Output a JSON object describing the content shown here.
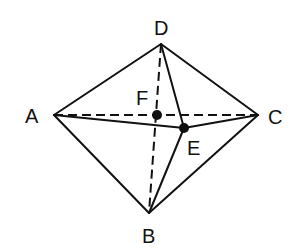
{
  "diagram": {
    "type": "octahedron-like solid",
    "points": {
      "A": {
        "label": "A",
        "x": 54,
        "y": 115
      },
      "B": {
        "label": "B",
        "x": 149,
        "y": 213
      },
      "C": {
        "label": "C",
        "x": 258,
        "y": 115
      },
      "D": {
        "label": "D",
        "x": 161,
        "y": 44
      },
      "E": {
        "label": "E",
        "x": 184,
        "y": 128
      },
      "F": {
        "label": "F",
        "x": 157,
        "y": 115
      }
    },
    "solid_edges": [
      "DA",
      "DC",
      "AB",
      "BC",
      "AE",
      "EC",
      "DE",
      "EB"
    ],
    "dashed_edges": [
      "AC",
      "DB"
    ],
    "marked_points": [
      "E",
      "F"
    ],
    "line_color": "#111111"
  }
}
